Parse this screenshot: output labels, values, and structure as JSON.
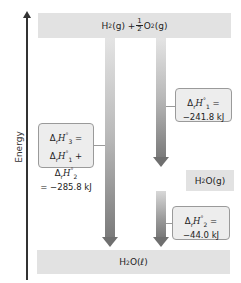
{
  "axis": {
    "label": "Energy"
  },
  "levels": {
    "top": {
      "species1": "H",
      "sub1": "2",
      "state1": "(g) + ",
      "frac_num": "1",
      "frac_den": "2",
      "species2": " O",
      "sub2": "2",
      "state2": "(g)"
    },
    "middle": {
      "species": "H",
      "sub": "2",
      "rest": "O(g)"
    },
    "bottom": {
      "species": "H",
      "sub": "2",
      "rest": "O(ℓ)"
    }
  },
  "boxes": {
    "step1": {
      "delta": "Δ",
      "r": "r",
      "H": "H",
      "deg": "°",
      "idx": "1",
      "eq": " =",
      "value": "−241.8 kJ"
    },
    "step2": {
      "delta": "Δ",
      "r": "r",
      "H": "H",
      "deg": "°",
      "idx": "2",
      "eq": " =",
      "value": "−44.0 kJ"
    },
    "step3": {
      "line1_delta": "Δ",
      "r": "r",
      "H": "H",
      "deg": "°",
      "idx": "3",
      "eq": " =",
      "sum_a_idx": "1",
      "plus": " + ",
      "sum_b_idx": "2",
      "value": "= −285.8 kJ"
    }
  },
  "colors": {
    "level_fill": "#e2e2e2",
    "box_fill": "#ededed",
    "box_border": "#9a9a9a",
    "arrow_dark": "#6f6f6f",
    "axis": "#333333"
  }
}
